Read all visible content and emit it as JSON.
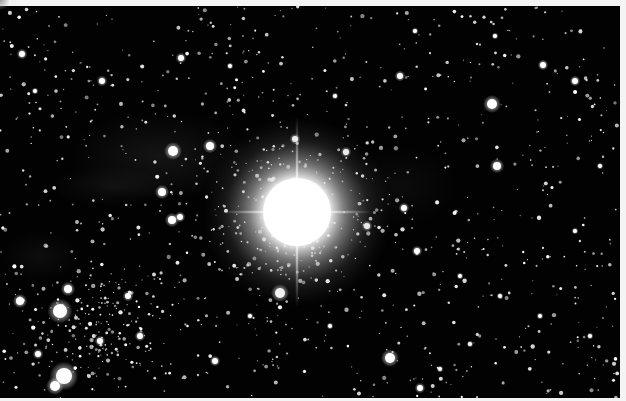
{
  "image": {
    "subject": "bright star with diffraction spikes in dense star field",
    "background_color": "#020202",
    "border_color": "#f4f4f4",
    "width": 620,
    "height": 392
  },
  "central_star": {
    "cx": 297,
    "cy": 206,
    "core_radius": 34,
    "halo_radius": 95,
    "spike_vertical_length": 95,
    "spike_horizontal_length": 75,
    "color": "#ffffff"
  },
  "nebulosity": [
    {
      "cx": 160,
      "cy": 150,
      "rx": 90,
      "ry": 45,
      "opacity": 0.1
    },
    {
      "cx": 110,
      "cy": 180,
      "rx": 60,
      "ry": 20,
      "opacity": 0.07
    },
    {
      "cx": 40,
      "cy": 250,
      "rx": 40,
      "ry": 25,
      "opacity": 0.06
    },
    {
      "cx": 400,
      "cy": 180,
      "rx": 60,
      "ry": 40,
      "opacity": 0.05
    }
  ],
  "bright_stars": [
    {
      "x": 60,
      "y": 305,
      "r": 7
    },
    {
      "x": 20,
      "y": 295,
      "r": 4
    },
    {
      "x": 68,
      "y": 283,
      "r": 4
    },
    {
      "x": 64,
      "y": 370,
      "r": 8
    },
    {
      "x": 55,
      "y": 380,
      "r": 5
    },
    {
      "x": 38,
      "y": 348,
      "r": 3
    },
    {
      "x": 173,
      "y": 145,
      "r": 5
    },
    {
      "x": 210,
      "y": 140,
      "r": 4
    },
    {
      "x": 162,
      "y": 186,
      "r": 4
    },
    {
      "x": 172,
      "y": 214,
      "r": 4
    },
    {
      "x": 180,
      "y": 211,
      "r": 3
    },
    {
      "x": 280,
      "y": 287,
      "r": 5
    },
    {
      "x": 390,
      "y": 352,
      "r": 5
    },
    {
      "x": 492,
      "y": 98,
      "r": 5
    },
    {
      "x": 497,
      "y": 160,
      "r": 4
    },
    {
      "x": 400,
      "y": 70,
      "r": 3
    },
    {
      "x": 181,
      "y": 52,
      "r": 3
    },
    {
      "x": 102,
      "y": 75,
      "r": 3
    },
    {
      "x": 22,
      "y": 48,
      "r": 3
    },
    {
      "x": 35,
      "y": 85,
      "r": 2
    },
    {
      "x": 295,
      "y": 133,
      "r": 3
    },
    {
      "x": 346,
      "y": 146,
      "r": 3
    },
    {
      "x": 367,
      "y": 220,
      "r": 3
    },
    {
      "x": 417,
      "y": 245,
      "r": 3
    },
    {
      "x": 404,
      "y": 202,
      "r": 3
    },
    {
      "x": 543,
      "y": 59,
      "r": 3
    },
    {
      "x": 575,
      "y": 75,
      "r": 3
    },
    {
      "x": 575,
      "y": 225,
      "r": 2
    },
    {
      "x": 495,
      "y": 30,
      "r": 2
    },
    {
      "x": 415,
      "y": 25,
      "r": 2
    },
    {
      "x": 230,
      "y": 60,
      "r": 2
    },
    {
      "x": 335,
      "y": 90,
      "r": 2
    },
    {
      "x": 100,
      "y": 335,
      "r": 3
    },
    {
      "x": 140,
      "y": 330,
      "r": 3
    },
    {
      "x": 128,
      "y": 290,
      "r": 3
    },
    {
      "x": 215,
      "y": 355,
      "r": 3
    },
    {
      "x": 420,
      "y": 382,
      "r": 3
    },
    {
      "x": 440,
      "y": 363,
      "r": 2
    },
    {
      "x": 470,
      "y": 338,
      "r": 2
    },
    {
      "x": 500,
      "y": 290,
      "r": 2
    },
    {
      "x": 460,
      "y": 270,
      "r": 2
    },
    {
      "x": 330,
      "y": 320,
      "r": 2
    },
    {
      "x": 250,
      "y": 310,
      "r": 2
    },
    {
      "x": 540,
      "y": 310,
      "r": 2
    },
    {
      "x": 590,
      "y": 330,
      "r": 2
    },
    {
      "x": 600,
      "y": 160,
      "r": 2
    }
  ],
  "faint_stars": {
    "seed": 7331,
    "count": 900,
    "min_radius": 0.6,
    "max_radius": 2.2,
    "cluster": {
      "cx": 90,
      "cy": 320,
      "rx": 110,
      "ry": 80,
      "extra_count": 160
    },
    "core_cluster": {
      "cx": 297,
      "cy": 210,
      "rx": 170,
      "ry": 140,
      "extra_count": 220
    }
  }
}
